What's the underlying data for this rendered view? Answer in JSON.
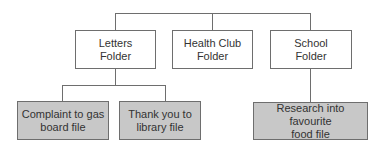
{
  "diagram": {
    "type": "hierarchy",
    "colors": {
      "line": "#6e6e6e",
      "folder_fill": "#ffffff",
      "file_fill": "#c8c8c8",
      "text": "#333333"
    },
    "folders": [
      {
        "label": "Letters\nFolder",
        "line1": "Letters",
        "line2": "Folder"
      },
      {
        "label": "Health Club\nFolder",
        "line1": "Health Club",
        "line2": "Folder"
      },
      {
        "label": "School\nFolder",
        "line1": "School",
        "line2": "Folder"
      }
    ],
    "files": [
      {
        "parent": "Letters Folder",
        "line1": "Complaint to gas",
        "line2": "board file"
      },
      {
        "parent": "Letters Folder",
        "line1": "Thank you to",
        "line2": "library file"
      },
      {
        "parent": "School Folder",
        "line1": "Research into favourite",
        "line2": "food file"
      }
    ]
  }
}
